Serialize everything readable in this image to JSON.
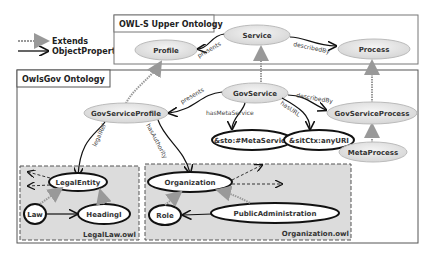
{
  "legend": {
    "extends_label": "Extends",
    "object_property_label": "ObjectProperty"
  },
  "upper_ontology": {
    "title": "OWL-S Upper Ontology",
    "nodes": {
      "profile": "Profile",
      "service": "Service",
      "process": "Process"
    },
    "edges": {
      "presents": "presents",
      "describedby": "describedBy"
    }
  },
  "gov_ontology": {
    "title": "OwlsGov Ontology",
    "nodes": {
      "gov_service_profile": "GovServiceProfile",
      "gov_service": "GovService",
      "gov_service_process": "GovServiceProcess",
      "meta_service": "&sto:#MetaService",
      "any_uri": "&sitCtx:anyURI",
      "meta_process": "MetaProcess"
    },
    "edges": {
      "presents": "presents",
      "has_meta_service": "hasMetaService",
      "describedby": "describedBy",
      "has_url": "hasURL",
      "legal_ref": "legalRef",
      "has_authority": "hasAuthority"
    }
  },
  "legal_law": {
    "label": "LegalLaw.owl",
    "nodes": {
      "legal_entity": "LegalEntity",
      "law": "Law",
      "heading": "HeadingI"
    }
  },
  "organization_owl": {
    "label": "Organization.owl",
    "nodes": {
      "organization": "Organization",
      "role": "Role",
      "public_administration": "PublicAdministration"
    }
  },
  "colors": {
    "node_fill": "#e6e6e6",
    "node_stroke": "#b0b0b0",
    "box_stroke": "#555555",
    "module_fill": "#dcdcdc",
    "extends": "#999999"
  }
}
